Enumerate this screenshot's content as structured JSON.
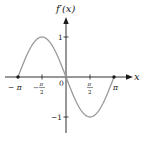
{
  "chart_data": {
    "type": "line",
    "title": "",
    "ylabel": "f'(x)",
    "xlabel": "x",
    "function": "f'(x) = -sin(x)",
    "xlim": [
      -3.14159,
      3.14159
    ],
    "ylim": [
      -1,
      1
    ],
    "grid": false,
    "legend": null,
    "x_ticks": [
      {
        "value": -3.14159,
        "label": "− π"
      },
      {
        "value": -1.5708,
        "label": "−π/2"
      },
      {
        "value": 0,
        "label": "0"
      },
      {
        "value": 1.5708,
        "label": "π/2"
      },
      {
        "value": 3.14159,
        "label": "π"
      }
    ],
    "y_ticks": [
      {
        "value": 1,
        "label": "1"
      },
      {
        "value": -1,
        "label": "−1"
      }
    ],
    "series": [
      {
        "name": "f'(x)",
        "color": "#9a9a9a",
        "x": [
          -3.14159,
          -2.35619,
          -1.5708,
          -0.7854,
          0,
          0.7854,
          1.5708,
          2.35619,
          3.14159
        ],
        "y": [
          0,
          0.707,
          1,
          0.707,
          0,
          -0.707,
          -1,
          -0.707,
          0
        ]
      }
    ],
    "points": [
      {
        "x": -3.14159,
        "y": 0,
        "marker": "dot"
      },
      {
        "x": 3.14159,
        "y": 0,
        "marker": "dot"
      }
    ]
  },
  "labels": {
    "y_axis": "f′(x)",
    "x_axis": "x",
    "tick_neg_pi": "− π",
    "tick_neg_pi_half_num": "π",
    "tick_pi_half_num": "π",
    "tick_den": "2",
    "tick_zero": "0",
    "tick_pi": "π",
    "tick_y_pos": "1",
    "tick_y_neg": "−1",
    "minus": "−"
  },
  "colors": {
    "axis": "#1a1a1a",
    "curve": "#9a9a9a"
  }
}
